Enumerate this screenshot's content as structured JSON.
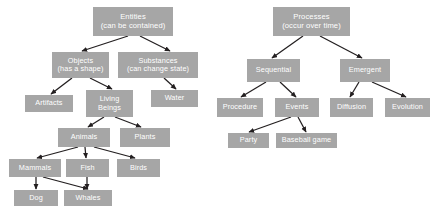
{
  "diagram": {
    "background_color": "#ffffff",
    "node_fill_color": "#a6a6a6",
    "node_text_color": "#ffffff",
    "edge_color": "#231f20",
    "nodes": [
      {
        "id": "entities",
        "label_line1": "Entities",
        "label_line2": "(can be contained)",
        "x": 93,
        "y": 7,
        "w": 80,
        "h": 29,
        "font_size": 7.6
      },
      {
        "id": "objects",
        "label_line1": "Objects",
        "label_line2": "(has a shape)",
        "x": 52,
        "y": 52,
        "w": 57,
        "h": 26,
        "font_size": 7.3
      },
      {
        "id": "substances",
        "label_line1": "Substances",
        "label_line2": "(can change state)",
        "x": 118,
        "y": 52,
        "w": 80,
        "h": 26,
        "font_size": 7.3
      },
      {
        "id": "artifacts",
        "label_line1": "Artifacts",
        "label_line2": "",
        "x": 25,
        "y": 95,
        "w": 48,
        "h": 17,
        "font_size": 7.3
      },
      {
        "id": "living-beings",
        "label_line1": "Living",
        "label_line2": "Beings",
        "x": 86,
        "y": 90,
        "w": 47,
        "h": 27,
        "font_size": 7.3
      },
      {
        "id": "water",
        "label_line1": "Water",
        "label_line2": "",
        "x": 151,
        "y": 90,
        "w": 47,
        "h": 17,
        "font_size": 7.3
      },
      {
        "id": "animals",
        "label_line1": "Animals",
        "label_line2": "",
        "x": 58,
        "y": 128,
        "w": 52,
        "h": 19,
        "font_size": 7.3
      },
      {
        "id": "plants",
        "label_line1": "Plants",
        "label_line2": "",
        "x": 120,
        "y": 128,
        "w": 50,
        "h": 19,
        "font_size": 7.3
      },
      {
        "id": "mammals",
        "label_line1": "Mammals",
        "label_line2": "",
        "x": 9,
        "y": 159,
        "w": 52,
        "h": 18,
        "font_size": 7.3
      },
      {
        "id": "fish",
        "label_line1": "Fish",
        "label_line2": "",
        "x": 66,
        "y": 159,
        "w": 43,
        "h": 18,
        "font_size": 7.3
      },
      {
        "id": "birds",
        "label_line1": "Birds",
        "label_line2": "",
        "x": 117,
        "y": 159,
        "w": 43,
        "h": 18,
        "font_size": 7.3
      },
      {
        "id": "dog",
        "label_line1": "Dog",
        "label_line2": "",
        "x": 14,
        "y": 190,
        "w": 44,
        "h": 16,
        "font_size": 7.3
      },
      {
        "id": "whales",
        "label_line1": "Whales",
        "label_line2": "",
        "x": 64,
        "y": 190,
        "w": 48,
        "h": 16,
        "font_size": 7.3
      },
      {
        "id": "processes",
        "label_line1": "Processes",
        "label_line2": "(occur over time)",
        "x": 273,
        "y": 7,
        "w": 77,
        "h": 29,
        "font_size": 7.6
      },
      {
        "id": "sequential",
        "label_line1": "Sequential",
        "label_line2": "",
        "x": 247,
        "y": 59,
        "w": 53,
        "h": 23,
        "font_size": 7.3
      },
      {
        "id": "emergent",
        "label_line1": "Emergent",
        "label_line2": "",
        "x": 340,
        "y": 59,
        "w": 50,
        "h": 23,
        "font_size": 7.3
      },
      {
        "id": "procedure",
        "label_line1": "Procedure",
        "label_line2": "",
        "x": 217,
        "y": 98,
        "w": 46,
        "h": 19,
        "font_size": 7.3
      },
      {
        "id": "events",
        "label_line1": "Events",
        "label_line2": "",
        "x": 275,
        "y": 98,
        "w": 44,
        "h": 19,
        "font_size": 7.3
      },
      {
        "id": "diffusion",
        "label_line1": "Diffusion",
        "label_line2": "",
        "x": 330,
        "y": 98,
        "w": 43,
        "h": 19,
        "font_size": 7.3
      },
      {
        "id": "evolution",
        "label_line1": "Evolution",
        "label_line2": "",
        "x": 385,
        "y": 98,
        "w": 45,
        "h": 19,
        "font_size": 7.3
      },
      {
        "id": "party",
        "label_line1": "Party",
        "label_line2": "",
        "x": 228,
        "y": 133,
        "w": 41,
        "h": 15,
        "font_size": 7.3
      },
      {
        "id": "baseball-game",
        "label_line1": "Baseball game",
        "label_line2": "",
        "x": 276,
        "y": 133,
        "w": 61,
        "h": 15,
        "font_size": 7.3
      }
    ],
    "edges": [
      {
        "from": "entities",
        "to": "objects",
        "x1": 128,
        "y1": 36,
        "x2": 82,
        "y2": 51
      },
      {
        "from": "entities",
        "to": "substances",
        "x1": 140,
        "y1": 36,
        "x2": 170,
        "y2": 51
      },
      {
        "from": "objects",
        "to": "artifacts",
        "x1": 72,
        "y1": 78,
        "x2": 51,
        "y2": 94
      },
      {
        "from": "objects",
        "to": "living-beings",
        "x1": 90,
        "y1": 78,
        "x2": 112,
        "y2": 89
      },
      {
        "from": "substances",
        "to": "water",
        "x1": 164,
        "y1": 78,
        "x2": 176,
        "y2": 89
      },
      {
        "from": "living-beings",
        "to": "animals",
        "x1": 104,
        "y1": 117,
        "x2": 88,
        "y2": 127
      },
      {
        "from": "living-beings",
        "to": "plants",
        "x1": 115,
        "y1": 117,
        "x2": 141,
        "y2": 127
      },
      {
        "from": "animals",
        "to": "mammals",
        "x1": 78,
        "y1": 147,
        "x2": 37,
        "y2": 158
      },
      {
        "from": "animals",
        "to": "fish",
        "x1": 85,
        "y1": 147,
        "x2": 86,
        "y2": 158
      },
      {
        "from": "animals",
        "to": "birds",
        "x1": 94,
        "y1": 147,
        "x2": 135,
        "y2": 158
      },
      {
        "from": "mammals",
        "to": "dog",
        "x1": 36,
        "y1": 177,
        "x2": 36,
        "y2": 189
      },
      {
        "from": "mammals",
        "to": "whales",
        "x1": 43,
        "y1": 177,
        "x2": 88,
        "y2": 189
      },
      {
        "from": "fish",
        "to": "whales",
        "x1": 87,
        "y1": 177,
        "x2": 87,
        "y2": 189
      },
      {
        "from": "processes",
        "to": "sequential",
        "x1": 303,
        "y1": 36,
        "x2": 272,
        "y2": 58
      },
      {
        "from": "processes",
        "to": "emergent",
        "x1": 320,
        "y1": 36,
        "x2": 362,
        "y2": 58
      },
      {
        "from": "sequential",
        "to": "procedure",
        "x1": 266,
        "y1": 82,
        "x2": 241,
        "y2": 97
      },
      {
        "from": "sequential",
        "to": "events",
        "x1": 280,
        "y1": 82,
        "x2": 296,
        "y2": 97
      },
      {
        "from": "emergent",
        "to": "diffusion",
        "x1": 359,
        "y1": 82,
        "x2": 350,
        "y2": 97
      },
      {
        "from": "emergent",
        "to": "evolution",
        "x1": 372,
        "y1": 82,
        "x2": 406,
        "y2": 97
      },
      {
        "from": "events",
        "to": "party",
        "x1": 291,
        "y1": 117,
        "x2": 249,
        "y2": 132
      },
      {
        "from": "events",
        "to": "baseball-game",
        "x1": 298,
        "y1": 117,
        "x2": 306,
        "y2": 132
      }
    ]
  }
}
